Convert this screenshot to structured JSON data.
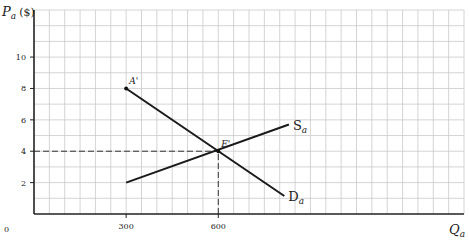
{
  "chart_data": {
    "type": "line",
    "title": "",
    "xlabel": "Q_a",
    "ylabel": "P_a ($)",
    "xlim": [
      0,
      1400
    ],
    "ylim": [
      0,
      13
    ],
    "grid": true,
    "x_ticks": [
      0,
      300,
      600
    ],
    "y_ticks": [
      2,
      4,
      6,
      8,
      10
    ],
    "series": [
      {
        "name": "S_a",
        "label": "S",
        "subscript": "a",
        "points": [
          [
            300,
            2
          ],
          [
            830,
            5.7
          ]
        ]
      },
      {
        "name": "D_a",
        "label": "D",
        "subscript": "a",
        "points": [
          [
            300,
            8
          ],
          [
            815,
            1.15
          ]
        ]
      }
    ],
    "annotations": [
      {
        "text": "A'",
        "x": 300,
        "y": 8,
        "type": "point"
      },
      {
        "text": "E'",
        "x": 600,
        "y": 4,
        "type": "point"
      }
    ],
    "reference_lines": [
      {
        "type": "horizontal",
        "y": 4,
        "x_from": 0,
        "x_to": 600,
        "style": "dashed"
      },
      {
        "type": "vertical",
        "x": 600,
        "y_from": 0,
        "y_to": 4,
        "style": "dashed"
      }
    ]
  },
  "labels": {
    "y_axis_main": "P",
    "y_axis_sub": "a",
    "y_axis_unit": "($)",
    "x_axis_main": "Q",
    "x_axis_sub": "a",
    "origin": "0"
  }
}
